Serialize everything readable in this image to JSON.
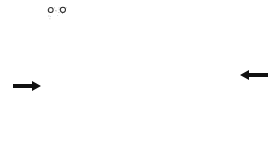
{
  "figure": {
    "colors": {
      "background": "#ffffff",
      "bubble_stroke": "#2a2a2a",
      "speckle": "#6a6a6a",
      "arrow": "#111111"
    },
    "lattice": {
      "x_min": 48,
      "x_max": 229,
      "y_min": 7,
      "y_max": 146,
      "row_spacing": 7.4,
      "col_spacing": 11.8,
      "bubble_radius": 2.6,
      "cut_corner": {
        "x1": 48,
        "y1": 21,
        "x2": 76,
        "y2": 7
      },
      "bottom_right_cut": {
        "x1": 180,
        "y1": 146,
        "x2": 229,
        "y2": 132
      },
      "grain_boundary": {
        "x1": 73,
        "y1": 7,
        "x2": 186,
        "y2": 146,
        "width": 5
      }
    },
    "arrows": [
      {
        "name": "left-arrow",
        "direction": "right",
        "x1": 13,
        "x2": 41,
        "y": 86
      },
      {
        "name": "right-arrow",
        "direction": "left",
        "x1": 240,
        "x2": 268,
        "y": 75
      }
    ]
  }
}
